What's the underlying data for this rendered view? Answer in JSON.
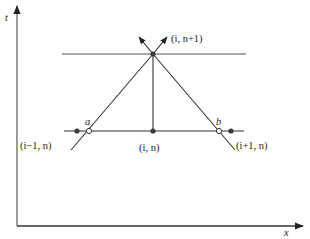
{
  "diagram": {
    "type": "finite-difference characteristic stencil",
    "axes": {
      "x_label": "x",
      "y_label": "t"
    },
    "points": {
      "top": {
        "label": "(i, n+1)"
      },
      "center": {
        "label": "(i, n)"
      },
      "left": {
        "label": "(i−1, n)"
      },
      "right": {
        "label": "(i+1, n)"
      },
      "foot_left": {
        "label": "a"
      },
      "foot_right": {
        "label": "b"
      }
    },
    "colors": {
      "line": "#2a2a2a",
      "axis": "#555555",
      "point": "#3a3a3a"
    }
  }
}
